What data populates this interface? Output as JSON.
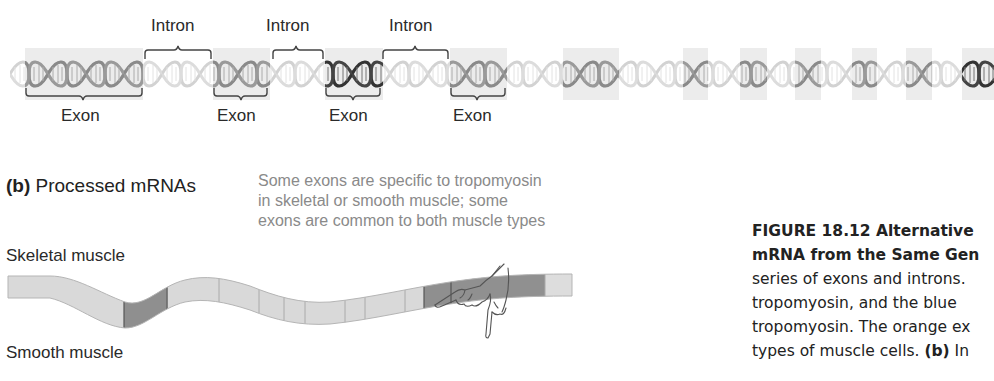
{
  "gene_panel": {
    "intron_labels": [
      "Intron",
      "Intron",
      "Intron"
    ],
    "exon_labels": [
      "Exon",
      "Exon",
      "Exon",
      "Exon"
    ],
    "exon_boxes": [
      {
        "x": 25,
        "w": 118,
        "shade": "mid"
      },
      {
        "x": 213,
        "w": 57,
        "shade": "mid"
      },
      {
        "x": 325,
        "w": 58,
        "shade": "dark"
      },
      {
        "x": 450,
        "w": 57,
        "shade": "mid"
      },
      {
        "x": 563,
        "w": 56,
        "shade": "mid"
      },
      {
        "x": 683,
        "w": 25,
        "shade": "mid"
      },
      {
        "x": 740,
        "w": 27,
        "shade": "mid"
      },
      {
        "x": 795,
        "w": 26,
        "shade": "mid"
      },
      {
        "x": 852,
        "w": 25,
        "shade": "mid"
      },
      {
        "x": 906,
        "w": 26,
        "shade": "mid"
      },
      {
        "x": 962,
        "w": 32,
        "shade": "dark"
      }
    ]
  },
  "mrna_panel": {
    "panel_letter": "(b)",
    "title": "Processed mRNAs",
    "note_lines": [
      "Some exons are specific to tropomyosin",
      "in skeletal or smooth muscle; some",
      "exons are common to both muscle types"
    ],
    "skeletal_label": "Skeletal muscle",
    "smooth_label": "Smooth muscle"
  },
  "caption": {
    "line1_bold": "FIGURE 18.12  Alternative",
    "line2_bold": "mRNA from the Same Gen",
    "line3": "series of exons and introns.",
    "line4": "tropomyosin, and the blue",
    "line5": "tropomyosin. The orange ex",
    "line6_pre": "types of muscle cells. ",
    "line6_bold": "(b)",
    "line6_post": " In"
  },
  "colors": {
    "exon_bg": "#ececec",
    "helix_light": "#d6d6d6",
    "helix_mid": "#8c8c8c",
    "helix_dark": "#3a3a3a",
    "mrna_light": "#d9d9d9",
    "mrna_dark": "#8f8f8f",
    "note_text": "#8a8a8a"
  }
}
